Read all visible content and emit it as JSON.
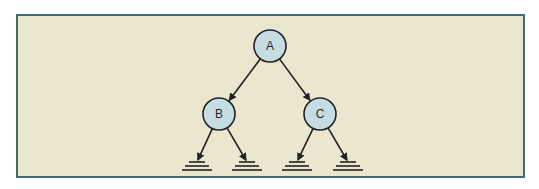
{
  "diagram": {
    "type": "binary-tree",
    "colors": {
      "background": "#ebe7cf",
      "frame_border": "#3f6d6b",
      "node_fill": "#c5dde2",
      "node_stroke": "#222222",
      "edge": "#222222"
    },
    "nodes": [
      {
        "id": "A",
        "label": "A",
        "cx": 270,
        "cy": 46
      },
      {
        "id": "B",
        "label": "B",
        "cx": 219,
        "cy": 114
      },
      {
        "id": "C",
        "label": "C",
        "cx": 320,
        "cy": 114
      }
    ],
    "edges": [
      {
        "from": "A",
        "to": "B"
      },
      {
        "from": "A",
        "to": "C"
      },
      {
        "from": "B",
        "to": "null-1"
      },
      {
        "from": "B",
        "to": "null-2"
      },
      {
        "from": "C",
        "to": "null-3"
      },
      {
        "from": "C",
        "to": "null-4"
      }
    ],
    "null_terminals": [
      {
        "id": "null-1",
        "x": 197,
        "y": 162
      },
      {
        "id": "null-2",
        "x": 247,
        "y": 162
      },
      {
        "id": "null-3",
        "x": 297,
        "y": 162
      },
      {
        "id": "null-4",
        "x": 348,
        "y": 162
      }
    ]
  }
}
